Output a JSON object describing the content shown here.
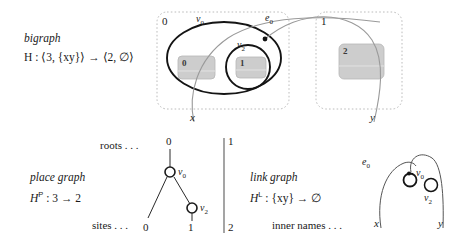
{
  "figure": {
    "title_hidden": "Bigraph H decomposed into place graph and link graph",
    "colors": {
      "ink": "#1a1a1a",
      "region_dash": "#b9b9b9",
      "site_fill": "#cfcfcf",
      "site_stroke": "#a8a8a8",
      "link_stroke": "#8f8f8f",
      "node_stroke": "#1a1a1a"
    }
  },
  "bigraph": {
    "caption_name": "bigraph",
    "caption_formula_prefix": "H",
    "caption_formula": "H : ⟨3, {xy}⟩ → ⟨2, ∅⟩",
    "formula_parts": {
      "symbol": "H",
      "colon": " : ",
      "inner": "⟨3, {xy}⟩",
      "arrow": " → ",
      "outer": "⟨2, ∅⟩"
    },
    "regions": [
      {
        "label": "0",
        "name": "region-0"
      },
      {
        "label": "1",
        "name": "region-1"
      }
    ],
    "nodes": [
      {
        "id": "v0",
        "base": "v",
        "sub": "0"
      },
      {
        "id": "v2",
        "base": "v",
        "sub": "2"
      }
    ],
    "edges": [
      {
        "id": "e0",
        "base": "e",
        "sub": "0"
      }
    ],
    "sites": [
      {
        "label": "0"
      },
      {
        "label": "1"
      },
      {
        "label": "2"
      }
    ],
    "names": [
      {
        "label": "x"
      },
      {
        "label": "y"
      }
    ]
  },
  "place_graph": {
    "caption_name": "place graph",
    "caption_formula": "Hᴾ : 3 → 2",
    "formula_parts": {
      "symbol": "H",
      "superscript": "P",
      "colon": " : ",
      "inner": "3",
      "arrow": " → ",
      "outer": "2"
    },
    "roots_label": "roots . . .",
    "sites_label": "sites . . .",
    "roots": [
      {
        "label": "0"
      },
      {
        "label": "1"
      }
    ],
    "nodes": [
      {
        "id": "v0",
        "base": "v",
        "sub": "0"
      },
      {
        "id": "v2",
        "base": "v",
        "sub": "2"
      }
    ],
    "sites": [
      {
        "label": "0"
      },
      {
        "label": "1"
      },
      {
        "label": "2"
      }
    ]
  },
  "link_graph": {
    "caption_name": "link graph",
    "caption_formula": "Hᴸ : {xy} → ∅",
    "formula_parts": {
      "symbol": "H",
      "superscript": "L",
      "colon": " : ",
      "inner": "{xy}",
      "arrow": " → ",
      "outer": "∅"
    },
    "inner_names_label": "inner names . . .",
    "edges": [
      {
        "id": "e0",
        "base": "e",
        "sub": "0"
      }
    ],
    "nodes": [
      {
        "id": "v0",
        "base": "v",
        "sub": "0"
      },
      {
        "id": "v2",
        "base": "v",
        "sub": "2"
      }
    ],
    "names": [
      {
        "label": "x"
      },
      {
        "label": "y"
      }
    ]
  }
}
